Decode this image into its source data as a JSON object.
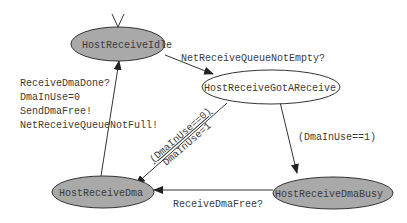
{
  "diagram": {
    "type": "state-machine",
    "colors": {
      "filled_state": "#a9a9a9",
      "open_state": "#ffffff",
      "stroke": "#333333",
      "text": "#3a3a3a"
    },
    "states": [
      {
        "id": "idle",
        "label": "HostReceiveIdle",
        "filled": true,
        "initial": true
      },
      {
        "id": "gotareceive",
        "label": "HostReceiveGotAReceive",
        "filled": false
      },
      {
        "id": "dma",
        "label": "HostReceiveDma",
        "filled": true
      },
      {
        "id": "dmabusy",
        "label": "HostReceiveDmaBusy",
        "filled": true
      }
    ],
    "transitions": [
      {
        "from": "idle",
        "to": "gotareceive",
        "label": "NetReceiveQueueNotEmpty?"
      },
      {
        "from": "gotareceive",
        "to": "dmabusy",
        "label": "(DmaInUse==1)"
      },
      {
        "from": "gotareceive",
        "to": "dma",
        "label_top": "(DmaInUse==0)",
        "label_bottom": "DmaInUse=1"
      },
      {
        "from": "dmabusy",
        "to": "dma",
        "label": "ReceiveDmaFree?"
      },
      {
        "from": "dma",
        "to": "idle",
        "label_lines": [
          "ReceiveDmaDone?",
          "DmaInUse=0",
          "SendDmaFree!",
          "NetReceiveQueueNotFull!"
        ]
      }
    ]
  }
}
